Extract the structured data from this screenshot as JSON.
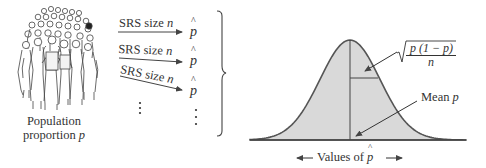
{
  "population": {
    "illustration": "crowd-of-people",
    "caption_line1": "Population",
    "caption_line2": "proportion",
    "caption_var": "p"
  },
  "samples": {
    "rows": [
      {
        "label": "SRS size",
        "var": "n",
        "result": "p"
      },
      {
        "label": "SRS size",
        "var": "n",
        "result": "p"
      },
      {
        "label": "SRS size",
        "var": "n",
        "result": "p"
      }
    ],
    "continuation": "⋮"
  },
  "distribution": {
    "sd_formula": {
      "numerator": "p (1 − p)",
      "denominator": "n",
      "symbol": "√"
    },
    "mean_label": "Mean",
    "mean_var": "p",
    "axis_label": "Values of",
    "axis_var": "p"
  },
  "colors": {
    "curve_fill": "#d9d9d9",
    "curve_stroke": "#555555",
    "line": "#333333"
  }
}
